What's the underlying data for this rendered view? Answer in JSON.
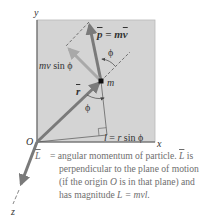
{
  "diagram": {
    "axes": {
      "x_label": "x",
      "y_label": "y",
      "z_label": "z",
      "origin_label": "O"
    },
    "labels": {
      "momentum": "p⃗ = mv⃗",
      "momentum_p": "p",
      "momentum_eq": " = m",
      "momentum_v": "v",
      "perp_component": "mv sin ϕ",
      "perp_component_mv": "mv",
      "perp_component_sin": " sin ϕ",
      "angle_top": "ϕ",
      "angle_bottom": "ϕ",
      "mass": "m",
      "position": "r",
      "lever_arm": "l = r sin ϕ",
      "lever_arm_l": "l",
      "lever_arm_eq": " = ",
      "lever_arm_r": "r",
      "lever_arm_sin": " sin ϕ",
      "angular_momentum": "L"
    },
    "colors": {
      "plane_fill": "#d4d4d4",
      "plane_border": "#9a9a9a",
      "vector_dark": "#7a7a7a",
      "vector_light": "#a9a9a9",
      "text": "#333333",
      "caption_text": "#6e6e6e"
    }
  },
  "caption": {
    "line1_prefix": "= angular momentum of particle. ",
    "line1_symbol": "L",
    "line1_suffix": " is",
    "line2": "perpendicular to the plane of motion",
    "line3_prefix": "(if the origin ",
    "line3_symbol": "O",
    "line3_suffix": " is in that plane) and",
    "line4_prefix": "has magnitude ",
    "line4_formula": "L = mvl."
  }
}
